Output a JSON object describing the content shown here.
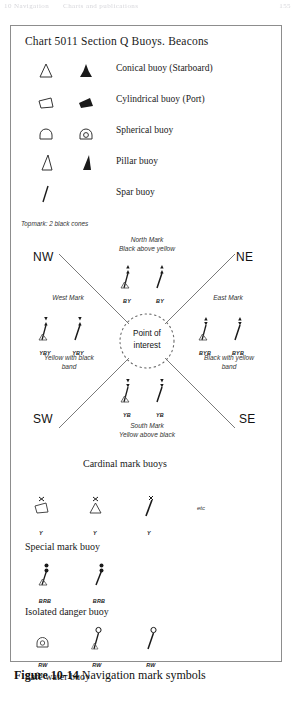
{
  "running_header": {
    "left_text": "10 Navigation",
    "mid_text": "Charts and publications",
    "page_number": "155"
  },
  "figure": {
    "chart_title": "Chart 5011 Section Q Buoys. Beacons",
    "legend_rows": [
      {
        "label": "Conical buoy (Starboard)",
        "symbol_a": "conical-buoy-outline-icon",
        "symbol_b": "conical-buoy-filled-icon"
      },
      {
        "label": "Cylindrical buoy (Port)",
        "symbol_a": "cylindrical-buoy-outline-icon",
        "symbol_b": "cylindrical-buoy-filled-icon"
      },
      {
        "label": "Spherical buoy",
        "symbol_a": "spherical-buoy-outline-icon",
        "symbol_b": "spherical-buoy-filled-icon"
      },
      {
        "label": "Pillar buoy",
        "symbol_a": "pillar-buoy-outline-icon",
        "symbol_b": "pillar-buoy-filled-icon"
      },
      {
        "label": "Spar buoy",
        "symbol_a": "spar-buoy-outline-icon",
        "symbol_b": ""
      }
    ],
    "topmark_note": "Topmark: 2 black cones",
    "cardinal": {
      "quadrants": {
        "nw": "NW",
        "ne": "NE",
        "sw": "SW",
        "se": "SE"
      },
      "point_of_interest": {
        "line1": "Point of",
        "line2": "interest"
      },
      "north": {
        "title_line1": "North Mark",
        "title_line2": "Black above yellow",
        "tags": [
          "BY",
          "BY"
        ]
      },
      "south": {
        "title_line1": "South Mark",
        "title_line2": "Yellow above black",
        "tags": [
          "YB",
          "YB"
        ]
      },
      "west": {
        "title": "West Mark",
        "band_line1": "Yellow with black",
        "band_line2": "band",
        "tags": [
          "YBY",
          "YBY"
        ]
      },
      "east": {
        "title": "East Mark",
        "band_line1": "Black with yellow",
        "band_line2": "band",
        "tags": [
          "BYB",
          "BYB"
        ]
      }
    },
    "captions": {
      "cardinal": "Cardinal mark buoys",
      "special": "Special mark buoy",
      "isolated": "Isolated danger buoy",
      "safe": "Safe water buoy"
    },
    "special_group": {
      "tags": [
        "Y",
        "Y",
        "Y"
      ],
      "etc": "etc"
    },
    "isolated_group": {
      "tags": [
        "BRB",
        "BRB"
      ]
    },
    "safe_group": {
      "tags": [
        "RW",
        "RW",
        "RW"
      ]
    }
  },
  "caption": {
    "figure_number": "Figure 10-14",
    "figure_title": " Navigation mark symbols"
  },
  "colors": {
    "ink": "#1a1a1a",
    "border": "#8d8d8d",
    "annotation": "#333333",
    "paper": "#ffffff"
  }
}
